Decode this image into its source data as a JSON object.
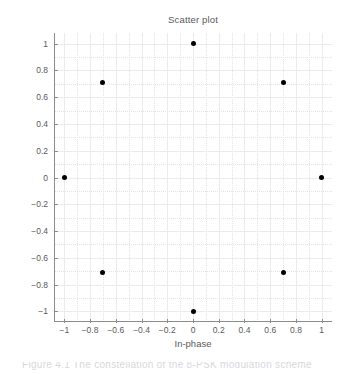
{
  "figure": {
    "title": "Scatter plot",
    "xlabel": "In-phase",
    "ylabel": "Quadrature",
    "caption": "Figure 4.1  The constellation of the 8-PSK modulation scheme"
  },
  "colors": {
    "marker": "#000000",
    "axis": "#8c8c8c",
    "grid": "#ebebeb",
    "text": "#595959",
    "background": "#ffffff"
  },
  "chart_data": {
    "type": "scatter",
    "title": "Scatter plot",
    "xlabel": "In-phase",
    "ylabel": "Quadrature",
    "xlim": [
      -1.08,
      1.08
    ],
    "ylim": [
      -1.08,
      1.08
    ],
    "grid": true,
    "legend": null,
    "xticks": [
      -1,
      -0.8,
      -0.6,
      -0.4,
      -0.2,
      0,
      0.2,
      0.4,
      0.6,
      0.8,
      1
    ],
    "yticks": [
      -1,
      -0.8,
      -0.6,
      -0.4,
      -0.2,
      0,
      0.2,
      0.4,
      0.6,
      0.8,
      1
    ],
    "xticklabels": [
      "-1",
      "-0.8",
      "-0.6",
      "-0.4",
      "-0.2",
      "0",
      "0.2",
      "0.4",
      "0.6",
      "0.8",
      "1"
    ],
    "yticklabels": [
      "1",
      "0.8",
      "0.6",
      "0.4",
      "0.2",
      "0",
      "-0.2",
      "-0.4",
      "-0.6",
      "-0.8",
      "-1"
    ],
    "series": [
      {
        "name": "8-PSK constellation",
        "marker": "filled-circle",
        "color": "#000000",
        "points": [
          {
            "x": 1.0,
            "y": 0.0
          },
          {
            "x": 0.707,
            "y": 0.707
          },
          {
            "x": 0.0,
            "y": 1.0
          },
          {
            "x": -0.707,
            "y": 0.707
          },
          {
            "x": -1.0,
            "y": 0.0
          },
          {
            "x": -0.707,
            "y": -0.707
          },
          {
            "x": 0.0,
            "y": -1.0
          },
          {
            "x": 0.707,
            "y": -0.707
          }
        ]
      }
    ]
  }
}
